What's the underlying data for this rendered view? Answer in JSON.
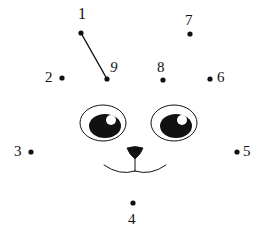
{
  "page": {
    "type": "connect-the-dots-puzzle",
    "background_color": "#ffffff",
    "ink_color": "#111111",
    "width": 263,
    "height": 227
  },
  "dots": [
    {
      "number": "1",
      "dot_x": 81,
      "dot_y": 33,
      "label_x": 78,
      "label_y": 6,
      "label_class": "num-1"
    },
    {
      "number": "2",
      "dot_x": 62,
      "dot_y": 78,
      "label_x": 45,
      "label_y": 70,
      "label_class": "num-2"
    },
    {
      "number": "3",
      "dot_x": 31,
      "dot_y": 152,
      "label_x": 14,
      "label_y": 144,
      "label_class": "num-3"
    },
    {
      "number": "4",
      "dot_x": 133,
      "dot_y": 203,
      "label_x": 128,
      "label_y": 212,
      "label_class": "num-4"
    },
    {
      "number": "5",
      "dot_x": 237,
      "dot_y": 152,
      "label_x": 243,
      "label_y": 144,
      "label_class": "num-5"
    },
    {
      "number": "6",
      "dot_x": 210,
      "dot_y": 79,
      "label_x": 217,
      "label_y": 70,
      "label_class": "num-6"
    },
    {
      "number": "7",
      "dot_x": 190,
      "dot_y": 34,
      "label_x": 185,
      "label_y": 13,
      "label_class": "num-7"
    },
    {
      "number": "8",
      "dot_x": 163,
      "dot_y": 80,
      "label_x": 157,
      "label_y": 60,
      "label_class": "num-8"
    },
    {
      "number": "9",
      "dot_x": 107,
      "dot_y": 79,
      "label_x": 110,
      "label_y": 60,
      "label_class": "num-9"
    }
  ],
  "connections": [
    {
      "from": "1",
      "to": "9",
      "x1": 81,
      "y1": 33,
      "x2": 107,
      "y2": 79
    }
  ],
  "face": {
    "left_eye": {
      "cx": 103,
      "cy": 123,
      "rx": 23,
      "ry": 18,
      "pupil_cx": 105,
      "pupil_cy": 126,
      "pupil_rx": 16,
      "pupil_ry": 12,
      "highlight_cx": 111,
      "highlight_cy": 120,
      "highlight_r": 5
    },
    "right_eye": {
      "cx": 174,
      "cy": 123,
      "rx": 23,
      "ry": 18,
      "pupil_cx": 176,
      "pupil_cy": 126,
      "pupil_rx": 16,
      "pupil_ry": 12,
      "highlight_cx": 182,
      "highlight_cy": 120,
      "highlight_r": 5
    },
    "nose": {
      "cx": 135,
      "top_y": 148,
      "bottom_y": 159,
      "half_width": 8
    },
    "mouth": {
      "center_x": 135,
      "center_y": 171,
      "left_end_x": 104,
      "right_end_x": 166,
      "end_y": 165,
      "dip_y": 176
    }
  }
}
